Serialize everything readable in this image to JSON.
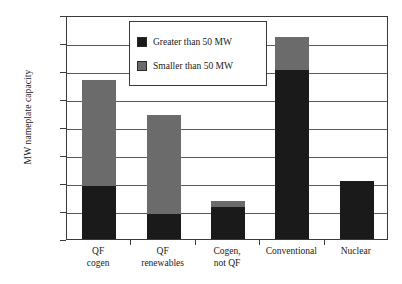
{
  "chart_data": {
    "type": "bar",
    "stacked": true,
    "title": "",
    "xlabel": "",
    "ylabel": "MW nameplate capacity",
    "ylim": [
      0,
      8000
    ],
    "ytick_labels": [
      "8,000",
      "7,000",
      "6,000",
      "5,000",
      "4,000",
      "3,000",
      "2,000",
      "1,000",
      "0"
    ],
    "ytick_values": [
      8000,
      7000,
      6000,
      5000,
      4000,
      3000,
      2000,
      1000,
      0
    ],
    "grid": true,
    "legend_position": "top-center",
    "categories": [
      {
        "line1": "QF",
        "line2": "cogen"
      },
      {
        "line1": "QF",
        "line2": "renewables"
      },
      {
        "line1": "Cogen,",
        "line2": "not QF"
      },
      {
        "line1": "Conventional",
        "line2": ""
      },
      {
        "line1": "Nuclear",
        "line2": ""
      }
    ],
    "series": [
      {
        "name": "Greater than 50 MW",
        "color": "#1a1a1a",
        "values": [
          1900,
          900,
          1150,
          6050,
          2080
        ]
      },
      {
        "name": "Smaller than 50 MW",
        "color": "#6b6b6b",
        "values": [
          3780,
          3540,
          200,
          1150,
          0
        ]
      }
    ],
    "totals": [
      5680,
      4440,
      1350,
      7200,
      2080
    ]
  },
  "legend": {
    "items": [
      {
        "label": "Greater than 50 MW",
        "swatch": "black-swatch-icon"
      },
      {
        "label": "Smaller than 50 MW",
        "swatch": "gray-swatch-icon"
      }
    ]
  },
  "caption": {
    "cut_off_line": ""
  }
}
